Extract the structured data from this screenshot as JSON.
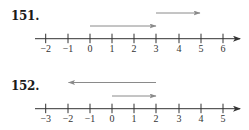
{
  "problems": [
    {
      "number": "151.",
      "number_line": {
        "ticks": [
          {
            "value": -2,
            "label": "−2",
            "x": 45.7
          },
          {
            "value": -1,
            "label": "−1",
            "x": 68
          },
          {
            "value": 0,
            "label": "0",
            "x": 90
          },
          {
            "value": 1,
            "label": "1",
            "x": 112
          },
          {
            "value": 2,
            "label": "2",
            "x": 134
          },
          {
            "value": 3,
            "label": "3",
            "x": 156
          },
          {
            "value": 4,
            "label": "4",
            "x": 179
          },
          {
            "value": 5,
            "label": "5",
            "x": 201
          },
          {
            "value": 6,
            "label": "6",
            "x": 223
          }
        ],
        "vectors": [
          {
            "from": 0,
            "to": 3,
            "direction": "right"
          },
          {
            "from": 3,
            "to": 5,
            "direction": "right"
          }
        ]
      }
    },
    {
      "number": "152.",
      "number_line": {
        "ticks": [
          {
            "value": -3,
            "label": "−3",
            "x": 45.7
          },
          {
            "value": -2,
            "label": "−2",
            "x": 68
          },
          {
            "value": -1,
            "label": "−1",
            "x": 90
          },
          {
            "value": 0,
            "label": "0",
            "x": 112
          },
          {
            "value": 1,
            "label": "1",
            "x": 134
          },
          {
            "value": 2,
            "label": "2",
            "x": 156
          },
          {
            "value": 3,
            "label": "3",
            "x": 179
          },
          {
            "value": 4,
            "label": "4",
            "x": 201
          },
          {
            "value": 5,
            "label": "5",
            "x": 223
          }
        ],
        "vectors": [
          {
            "from": 0,
            "to": 2,
            "direction": "right"
          },
          {
            "from": 2,
            "to": -2,
            "direction": "left"
          }
        ]
      }
    }
  ],
  "colors": {
    "axis": "#333333",
    "vector": "#8a8a8a",
    "text": "#1a1a1a"
  }
}
